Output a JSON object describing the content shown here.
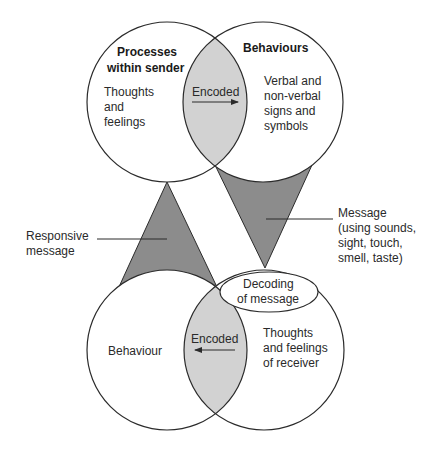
{
  "diagram": {
    "type": "communication-cycle",
    "colors": {
      "stroke": "#2b2b2b",
      "lens_fill": "#d2d2d2",
      "triangle_fill": "#8c8c8c",
      "background": "#ffffff"
    },
    "top_left_circle": {
      "heading_line1": "Processes",
      "heading_line2": "within sender",
      "body_line1": "Thoughts",
      "body_line2": "and",
      "body_line3": "feelings"
    },
    "top_lens": {
      "label": "Encoded",
      "arrow_direction": "right"
    },
    "top_right_circle": {
      "heading": "Behaviours",
      "body_line1": "Verbal and",
      "body_line2": "non-verbal",
      "body_line3": "signs and",
      "body_line4": "symbols"
    },
    "message_triangle": {
      "label_line1": "Message",
      "label_line2": "(using sounds,",
      "label_line3": "sight, touch,",
      "label_line4": "smell, taste)"
    },
    "responsive_triangle": {
      "label_line1": "Responsive",
      "label_line2": "message"
    },
    "decoding_ellipse": {
      "line1": "Decoding",
      "line2": "of message"
    },
    "bottom_left_circle": {
      "body": "Behaviour"
    },
    "bottom_lens": {
      "label": "Encoded",
      "arrow_direction": "left"
    },
    "bottom_right_circle": {
      "body_line1": "Thoughts",
      "body_line2": "and feelings",
      "body_line3": "of receiver"
    }
  }
}
